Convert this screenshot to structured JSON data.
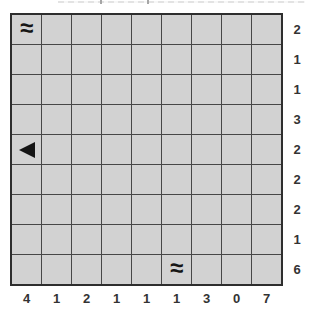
{
  "puzzle": {
    "grid_rows": 9,
    "grid_cols": 9,
    "row_tallies": [
      2,
      1,
      1,
      3,
      2,
      2,
      2,
      1,
      6
    ],
    "col_tallies": [
      4,
      1,
      2,
      1,
      1,
      1,
      3,
      0,
      7
    ],
    "water_symbol": "≈",
    "marked_cells": [
      {
        "row": 1,
        "col": 1,
        "type": "water"
      },
      {
        "row": 5,
        "col": 1,
        "type": "ship-end-left"
      },
      {
        "row": 9,
        "col": 6,
        "type": "water"
      }
    ]
  },
  "colors": {
    "background": "#ffffff",
    "cell_fill": "#d2d2d2",
    "grid_line": "#474747",
    "outer_border": "#2e2e2e",
    "tally_text": "#333333",
    "symbol": "#151515"
  }
}
